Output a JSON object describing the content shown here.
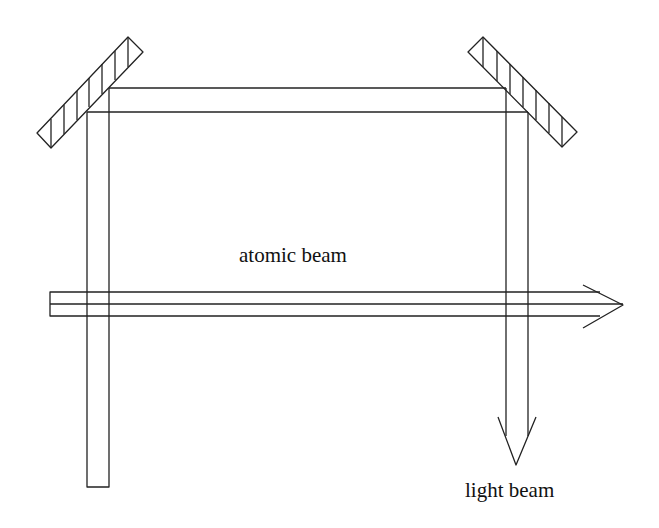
{
  "labels": {
    "atomic_beam": "atomic beam",
    "light_beam": "light beam"
  },
  "colors": {
    "stroke": "#222222",
    "background": "#ffffff"
  },
  "elements": {
    "mirrors": [
      "left-mirror",
      "right-mirror"
    ],
    "beams": [
      "atomic-beam",
      "light-beam"
    ]
  }
}
